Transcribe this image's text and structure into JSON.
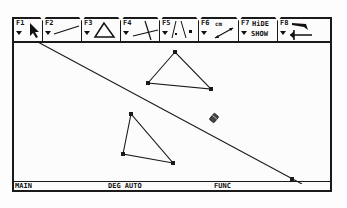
{
  "toolbar": {
    "tools": [
      {
        "key": "F1",
        "icon": "pointer-arrow-icon"
      },
      {
        "key": "F2",
        "icon": "line-segment-icon"
      },
      {
        "key": "F3",
        "icon": "triangle-icon"
      },
      {
        "key": "F4",
        "icon": "intersecting-lines-icon"
      },
      {
        "key": "F5",
        "icon": "points-icon"
      },
      {
        "key": "F6",
        "icon": "measure-icon",
        "label": "cm"
      },
      {
        "key": "F7",
        "label_top": "HiDE",
        "label_bottom": "SHOW"
      },
      {
        "key": "F8",
        "icon": "eraser-arrow-icon"
      }
    ]
  },
  "canvas": {
    "line": {
      "x1": 22,
      "y1": 0,
      "x2": 288,
      "y2": 143,
      "point": {
        "x": 278,
        "y": 138
      }
    },
    "triangles": [
      {
        "name": "upper",
        "points": [
          [
            161,
            11
          ],
          [
            134,
            42
          ],
          [
            197,
            48
          ]
        ]
      },
      {
        "name": "lower",
        "points": [
          [
            117,
            73
          ],
          [
            109,
            113
          ],
          [
            159,
            122
          ]
        ]
      }
    ],
    "cursor": {
      "x": 200,
      "y": 77,
      "icon": "eraser-cursor-icon"
    }
  },
  "status": {
    "folder": "MAIN",
    "mode": "DEG AUTO",
    "graph": "FUNC"
  },
  "colors": {
    "ink": "#1a1a1a",
    "background": "#fcfcfc"
  }
}
